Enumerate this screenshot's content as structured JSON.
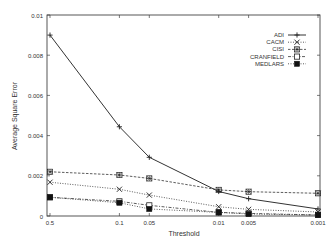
{
  "chart_data": {
    "type": "line",
    "title": "",
    "xlabel": "Threshold",
    "ylabel": "Average Square Error",
    "x": [
      "0.5",
      "0.1",
      "0.05",
      "0.01",
      "0.005",
      "0.001"
    ],
    "x_positions_log": true,
    "yticks": [
      "0",
      "0.002",
      "0.004",
      "0.006",
      "0.008",
      "0.01"
    ],
    "ylim": [
      0,
      0.01
    ],
    "grid": false,
    "legend_position": "upper right",
    "series": [
      {
        "name": "ADI",
        "marker": "plus",
        "line": "solid",
        "values": [
          0.009,
          0.00444,
          0.00292,
          0.00122,
          0.00086,
          0.00035
        ]
      },
      {
        "name": "CACM",
        "marker": "x",
        "line": "dotted",
        "values": [
          0.00168,
          0.00133,
          0.00104,
          0.00046,
          0.00033,
          0.0002
        ]
      },
      {
        "name": "CISI",
        "marker": "star-square",
        "line": "dashed",
        "values": [
          0.0022,
          0.00204,
          0.00187,
          0.0013,
          0.00121,
          0.00113
        ]
      },
      {
        "name": "CRANFIELD",
        "marker": "open-square",
        "line": "dash-dot",
        "values": [
          0.00093,
          0.00073,
          0.00053,
          0.00018,
          0.00013,
          5e-05
        ]
      },
      {
        "name": "MEDLARS",
        "marker": "filled-square",
        "line": "dotted",
        "values": [
          0.00093,
          0.00066,
          0.00035,
          0.00018,
          0.0001,
          5e-05
        ]
      }
    ]
  }
}
